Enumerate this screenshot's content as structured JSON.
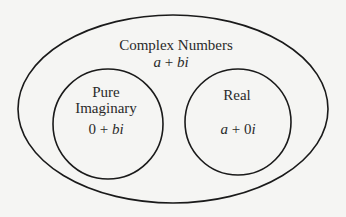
{
  "diagram": {
    "type": "venn",
    "outer": {
      "title": "Complex Numbers",
      "form_a": "a",
      "form_op": " + ",
      "form_b": "bi"
    },
    "left": {
      "title_line1": "Pure",
      "title_line2": "Imaginary",
      "form_a": "0",
      "form_op": " + ",
      "form_b": "bi"
    },
    "right": {
      "title": "Real",
      "form_a": "a",
      "form_op": " + 0",
      "form_b": "i"
    },
    "colors": {
      "background": "#f5f5f3",
      "stroke": "#1a1a1a",
      "text": "#2a2a2a"
    }
  }
}
